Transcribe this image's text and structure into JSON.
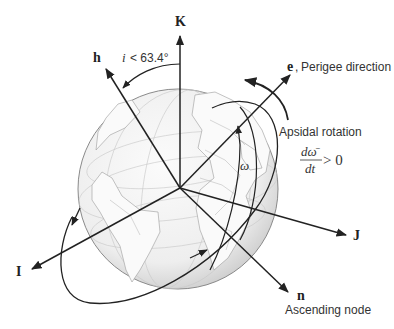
{
  "diagram": {
    "axes": {
      "K": "K",
      "I": "I",
      "J": "J",
      "h": "h",
      "e": "e",
      "n": "n"
    },
    "labels": {
      "inclination_var": "i",
      "inclination_cond": "< 63.4°",
      "perigee_sep": ",",
      "perigee_text": "Perigee direction",
      "apsidal_title": "Apsidal rotation",
      "derivative_num": "dω̄",
      "derivative_den": "dt",
      "derivative_cond": "> 0",
      "omega": "ω",
      "ascending_node": "Ascending node"
    },
    "colors": {
      "line": "#222222",
      "globe_fill": "#f0f0f0",
      "globe_edge": "#8a8a8a",
      "grid": "#c8c8c8",
      "text": "#333333"
    }
  }
}
